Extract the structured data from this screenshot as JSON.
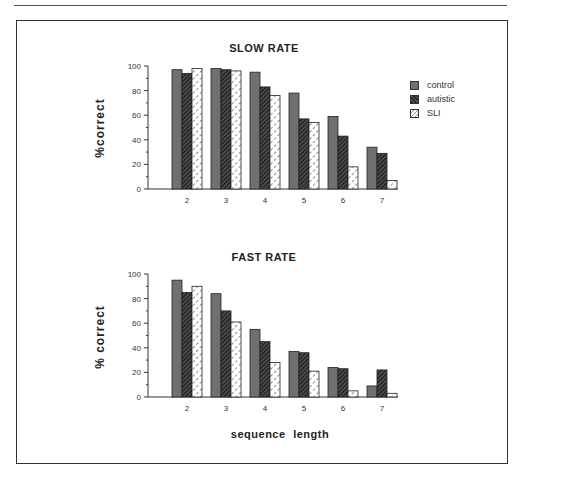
{
  "xlabel": "sequence length",
  "legend": [
    {
      "name": "control",
      "pattern": "solid-gray"
    },
    {
      "name": "autistic",
      "pattern": "dark-hatch"
    },
    {
      "name": "SLI",
      "pattern": "light-dotted"
    }
  ],
  "colors": {
    "control": "#707070",
    "autistic": "#3a3a3a",
    "SLI": "#ffffff",
    "axis": "#333333"
  },
  "chart_data": [
    {
      "type": "bar",
      "title": "SLOW RATE",
      "xlabel": "",
      "ylabel": "%correct",
      "ylim": [
        0,
        100
      ],
      "yticks": [
        0,
        20,
        40,
        60,
        80,
        100
      ],
      "categories": [
        "2",
        "3",
        "4",
        "5",
        "6",
        "7"
      ],
      "series": [
        {
          "name": "control",
          "values": [
            97,
            98,
            95,
            78,
            59,
            34
          ]
        },
        {
          "name": "autistic",
          "values": [
            94,
            97,
            83,
            57,
            43,
            29
          ]
        },
        {
          "name": "SLI",
          "values": [
            98,
            96,
            76,
            54,
            18,
            7
          ]
        }
      ],
      "grid": false,
      "legend_position": "right"
    },
    {
      "type": "bar",
      "title": "FAST RATE",
      "xlabel": "sequence length",
      "ylabel": "% correct",
      "ylim": [
        0,
        100
      ],
      "yticks": [
        0,
        20,
        40,
        60,
        80,
        100
      ],
      "categories": [
        "2",
        "3",
        "4",
        "5",
        "6",
        "7"
      ],
      "series": [
        {
          "name": "control",
          "values": [
            95,
            84,
            55,
            37,
            24,
            9
          ]
        },
        {
          "name": "autistic",
          "values": [
            85,
            70,
            45,
            36,
            23,
            22
          ]
        },
        {
          "name": "SLI",
          "values": [
            90,
            61,
            28,
            21,
            5,
            3
          ]
        }
      ],
      "grid": false
    }
  ]
}
